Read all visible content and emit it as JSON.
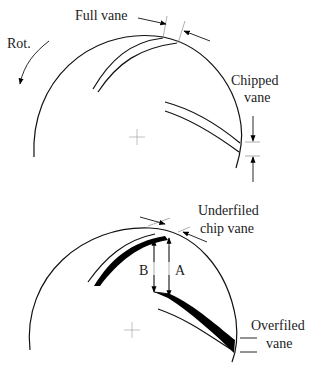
{
  "top_diagram": {
    "labels": {
      "full_vane": "Full vane",
      "rotation": "Rot.",
      "chipped_vane_line1": "Chipped",
      "chipped_vane_line2": "vane"
    }
  },
  "bottom_diagram": {
    "labels": {
      "underfiled_line1": "Underfiled",
      "underfiled_line2": "chip vane",
      "dim_b": "B",
      "dim_a": "A",
      "overfiled_line1": "Overfiled",
      "overfiled_line2": "vane"
    }
  },
  "colors": {
    "stroke": "#111111",
    "fill_black": "#000000",
    "background": "#ffffff"
  }
}
